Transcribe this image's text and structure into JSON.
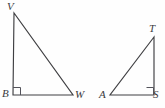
{
  "figure": {
    "background_color": "#fefefe",
    "stroke_color": "#3f3f42",
    "label_color": "#3a3a3d",
    "right_angle_mark_color": "#53535a"
  },
  "triangles": [
    {
      "name": "triangle-VBW",
      "vertices": [
        {
          "label": "V",
          "x": 14,
          "y": 13
        },
        {
          "label": "B",
          "x": 13,
          "y": 95
        },
        {
          "label": "W",
          "x": 73,
          "y": 95
        }
      ],
      "right_angle_at": "B",
      "right_angle_mark": {
        "x": 13,
        "y": 87,
        "size": 7
      }
    },
    {
      "name": "triangle-TAS",
      "vertices": [
        {
          "label": "T",
          "x": 154,
          "y": 37
        },
        {
          "label": "A",
          "x": 110,
          "y": 95
        },
        {
          "label": "S",
          "x": 154,
          "y": 95
        }
      ],
      "right_angle_at": "S",
      "right_angle_mark": {
        "x": 147,
        "y": 88,
        "size": 7
      }
    }
  ],
  "labels": {
    "V": "V",
    "B": "B",
    "W": "W",
    "T": "T",
    "A": "A",
    "S": "S"
  }
}
